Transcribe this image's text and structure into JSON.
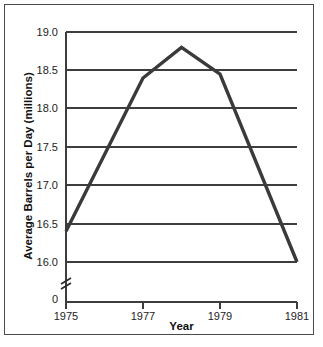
{
  "chart_data": {
    "type": "line",
    "title": "",
    "xlabel": "Year",
    "ylabel": "Average Barrels per Day (millions)",
    "x": [
      1975,
      1977,
      1978,
      1979,
      1981
    ],
    "values": [
      16.4,
      18.4,
      18.8,
      18.45,
      16.0
    ],
    "series": [
      {
        "name": "Average Barrels per Day",
        "values": [
          16.4,
          18.4,
          18.8,
          18.45,
          16.0
        ]
      }
    ],
    "xlim": [
      1975,
      1981
    ],
    "ylim": [
      16.0,
      19.0
    ],
    "y_axis_break": true,
    "y_axis_break_label": "0",
    "grid": true,
    "grid_axis": "y",
    "legend": "none",
    "xticks": [
      1975,
      1977,
      1979,
      1981
    ],
    "xtick_labels": [
      "1975",
      "1977",
      "1979",
      "1981"
    ],
    "yticks": [
      16.0,
      16.5,
      17.0,
      17.5,
      18.0,
      18.5,
      19.0
    ],
    "ytick_labels": [
      "16.0",
      "16.5",
      "17.0",
      "17.5",
      "18.0",
      "18.5",
      "19.0"
    ],
    "line_color": "#3a3a3a",
    "background_color": "#ffffff"
  },
  "axes": {
    "y_title": "Average Barrels per Day (millions)",
    "x_title": "Year",
    "zero_label": "0",
    "y_labels": [
      "19.0",
      "18.5",
      "18.0",
      "17.5",
      "17.0",
      "16.5",
      "16.0"
    ],
    "x_labels": [
      "1975",
      "1977",
      "1979",
      "1981"
    ]
  }
}
